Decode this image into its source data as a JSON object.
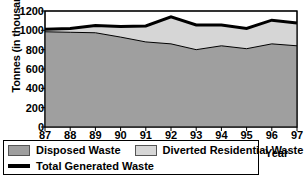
{
  "chart_data": {
    "type": "area",
    "stacked": true,
    "title": "",
    "xlabel": "Year",
    "ylabel": "Tonnes (in thousands)",
    "x": [
      "87",
      "88",
      "89",
      "90",
      "91",
      "92",
      "93",
      "94",
      "95",
      "96",
      "97"
    ],
    "xtick_labels": [
      "87",
      "88",
      "89",
      "90",
      "91",
      "92",
      "93",
      "94",
      "95",
      "96",
      "97"
    ],
    "ytick_labels": [
      "0",
      "200",
      "400",
      "600",
      "800",
      "1000",
      "1200"
    ],
    "ytick_values": [
      0,
      200,
      400,
      600,
      800,
      1000,
      1200
    ],
    "ylim": [
      0,
      1200
    ],
    "grid": false,
    "legend_position": "below-left",
    "series": [
      {
        "name": "Disposed Waste",
        "color": "#9f9f9f",
        "kind": "area-band",
        "values": [
          985,
          980,
          975,
          930,
          880,
          860,
          800,
          840,
          810,
          860,
          840
        ]
      },
      {
        "name": "Diverted Residential Waste",
        "color": "#d6d6d6",
        "kind": "area-band",
        "values": [
          25,
          40,
          75,
          110,
          165,
          280,
          255,
          215,
          210,
          245,
          235
        ]
      },
      {
        "name": "Total Generated Waste",
        "color": "#000000",
        "kind": "line",
        "values": [
          1010,
          1020,
          1050,
          1040,
          1045,
          1140,
          1055,
          1055,
          1020,
          1105,
          1075
        ]
      }
    ]
  },
  "axes": {
    "ylabel": "Tonnes (in thousands)",
    "xlabel": "Year"
  },
  "legend": {
    "items": [
      {
        "label": "Disposed Waste",
        "marker": "swatch-dark"
      },
      {
        "label": "Diverted Residential Waste",
        "marker": "swatch-light"
      },
      {
        "label": "Total Generated Waste",
        "marker": "line-black"
      }
    ]
  },
  "colors": {
    "disposed": "#9f9f9f",
    "diverted": "#d6d6d6",
    "total_line": "#000000",
    "axis": "#000000",
    "background": "#ffffff"
  }
}
